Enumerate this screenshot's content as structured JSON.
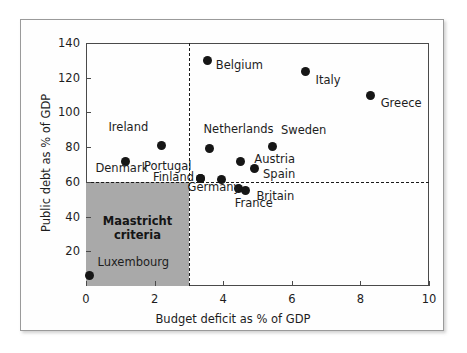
{
  "figure": {
    "border_color": "#9a9a9a",
    "background": "#ffffff"
  },
  "chart_data": {
    "type": "scatter",
    "title": "",
    "xlabel": "Budget deficit as % of GDP",
    "ylabel": "Public debt as % of GDP",
    "xlim": [
      0,
      10
    ],
    "ylim": [
      0,
      140
    ],
    "xticks": [
      0,
      2,
      4,
      6,
      8,
      10
    ],
    "yticks": [
      20,
      40,
      60,
      80,
      100,
      120,
      140
    ],
    "xtick_labels": [
      "0",
      "2",
      "4",
      "6",
      "8",
      "10"
    ],
    "ytick_labels": [
      "20",
      "40",
      "60",
      "80",
      "100",
      "120",
      "140"
    ],
    "grid": false,
    "legend": null,
    "marker_color": "#161616",
    "points": [
      {
        "name": "Luxembourg",
        "x": 0.1,
        "y": 6,
        "label_dx": 8,
        "label_dy": -14
      },
      {
        "name": "Denmark",
        "x": 1.15,
        "y": 72,
        "label_dx": -30,
        "label_dy": 7
      },
      {
        "name": "Ireland",
        "x": 2.2,
        "y": 81,
        "label_dx": -53,
        "label_dy": -18
      },
      {
        "name": "Belgium",
        "x": 3.55,
        "y": 130,
        "label_dx": 8,
        "label_dy": 5
      },
      {
        "name": "Netherlands",
        "x": 3.6,
        "y": 79.5,
        "label_dx": -6,
        "label_dy": -19
      },
      {
        "name": "Portugal",
        "x": 3.35,
        "y": 62,
        "label_dx": -57,
        "label_dy": -12
      },
      {
        "name": "Finland",
        "x": 3.35,
        "y": 62,
        "label_dx": -48,
        "label_dy": -1
      },
      {
        "name": "Germany",
        "x": 3.95,
        "y": 61.5,
        "label_dx": -34,
        "label_dy": 8
      },
      {
        "name": "Austria",
        "x": 4.5,
        "y": 72,
        "label_dx": 14,
        "label_dy": -2
      },
      {
        "name": "Spain",
        "x": 4.9,
        "y": 67.5,
        "label_dx": 9,
        "label_dy": 5
      },
      {
        "name": "France",
        "x": 4.45,
        "y": 56,
        "label_dx": -4,
        "label_dy": 14
      },
      {
        "name": "Britain",
        "x": 4.65,
        "y": 55,
        "label_dx": 11,
        "label_dy": 5
      },
      {
        "name": "Sweden",
        "x": 5.45,
        "y": 80.5,
        "label_dx": 8,
        "label_dy": -16
      },
      {
        "name": "Italy",
        "x": 6.4,
        "y": 123.5,
        "label_dx": 10,
        "label_dy": 8
      },
      {
        "name": "Greece",
        "x": 8.3,
        "y": 110,
        "label_dx": 10,
        "label_dy": 8
      }
    ],
    "reference_lines": [
      {
        "name": "deficit-threshold",
        "orientation": "vertical",
        "value": 3,
        "style": "dashed",
        "color": "#1a1a1a"
      },
      {
        "name": "debt-threshold",
        "orientation": "horizontal",
        "value": 60,
        "style": "dashed",
        "color": "#1a1a1a"
      }
    ],
    "shaded_regions": [
      {
        "name": "Maastricht criteria",
        "label_lines": [
          "Maastricht",
          "criteria"
        ],
        "x_range": [
          0,
          3
        ],
        "y_range": [
          0,
          60
        ],
        "color": "#a9a9a9"
      }
    ]
  }
}
